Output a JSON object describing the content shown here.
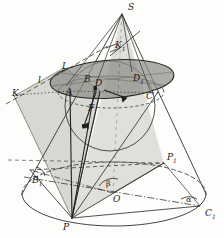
{
  "figure": {
    "type": "geometric-diagram",
    "style": "hand-drawn pencil sketch",
    "background_color": "#fdfdfc",
    "ink_color": "#2b2b2b",
    "plane_shade_color": "#c9c9c4",
    "ellipse_shade_color": "#9a9a93"
  },
  "labels": [
    {
      "id": "S",
      "text": "S",
      "sub": "",
      "x": 128,
      "y": 3,
      "desc": "cone-apex"
    },
    {
      "id": "K1",
      "text": "K",
      "sub": "1",
      "x": 115,
      "y": 41,
      "desc": "point-k-one"
    },
    {
      "id": "L",
      "text": "L",
      "sub": "",
      "x": 62,
      "y": 62,
      "desc": "point-l"
    },
    {
      "id": "l",
      "text": "l",
      "sub": "",
      "x": 38,
      "y": 76,
      "desc": "line-l"
    },
    {
      "id": "K",
      "text": "K",
      "sub": "",
      "x": 12,
      "y": 89,
      "desc": "point-k"
    },
    {
      "id": "A",
      "text": "A",
      "sub": "",
      "x": 66,
      "y": 88,
      "desc": "point-a"
    },
    {
      "id": "B",
      "text": "B",
      "sub": "",
      "x": 84,
      "y": 77,
      "desc": "point-b"
    },
    {
      "id": "D",
      "text": "D",
      "sub": "",
      "x": 95,
      "y": 81,
      "desc": "point-d"
    },
    {
      "id": "D1",
      "text": "D",
      "sub": "1",
      "x": 133,
      "y": 76,
      "desc": "point-d-one"
    },
    {
      "id": "C",
      "text": "C",
      "sub": "",
      "x": 146,
      "y": 93,
      "desc": "point-c"
    },
    {
      "id": "F",
      "text": "F",
      "sub": "",
      "x": 88,
      "y": 106,
      "desc": "focus-f"
    },
    {
      "id": "P1",
      "text": "P",
      "sub": "1",
      "x": 167,
      "y": 155,
      "desc": "point-p-one"
    },
    {
      "id": "B1",
      "text": "B",
      "sub": "1",
      "x": 32,
      "y": 178,
      "desc": "point-b-one"
    },
    {
      "id": "beta",
      "text": "β",
      "sub": "",
      "x": 106,
      "y": 181,
      "desc": "angle-beta"
    },
    {
      "id": "O",
      "text": "O",
      "sub": "",
      "x": 113,
      "y": 196,
      "desc": "center-o"
    },
    {
      "id": "alpha",
      "text": "α",
      "sub": "",
      "x": 190,
      "y": 198,
      "desc": "angle-alpha"
    },
    {
      "id": "C1",
      "text": "C",
      "sub": "1",
      "x": 206,
      "y": 211,
      "desc": "point-c-one"
    },
    {
      "id": "P",
      "text": "P",
      "sub": "",
      "x": 63,
      "y": 224,
      "desc": "point-p"
    }
  ],
  "geometry": {
    "apex": {
      "x": 122,
      "y": 14
    },
    "base_ellipse": {
      "cx": 114,
      "cy": 194,
      "rx": 92,
      "ry": 32
    },
    "sphere": {
      "cx": 110,
      "cy": 106,
      "r": 44
    },
    "section_ellipse": {
      "cx": 112,
      "cy": 79,
      "rx": 62,
      "ry": 19,
      "rotation": -4
    },
    "sphere_tangent_ellipse": {
      "cx": 113,
      "cy": 96,
      "rx": 53,
      "ry": 16
    }
  }
}
